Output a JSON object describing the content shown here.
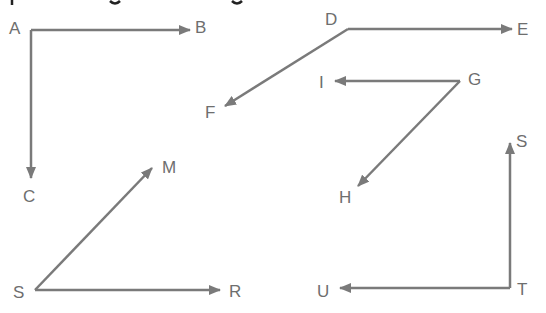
{
  "colors": {
    "stroke": "#7a7a7a",
    "label": "#6e6e6e",
    "background": "#ffffff"
  },
  "header": {
    "cropped_text_note": "top line of text cut off; only descenders visible"
  },
  "rays": [
    {
      "name": "AB",
      "from": "A",
      "to": "B",
      "x1": 31,
      "y1": 30,
      "x2": 190,
      "y2": 30
    },
    {
      "name": "AC",
      "from": "A",
      "to": "C",
      "x1": 31,
      "y1": 30,
      "x2": 31,
      "y2": 178
    },
    {
      "name": "DE",
      "from": "D",
      "to": "E",
      "x1": 348,
      "y1": 29,
      "x2": 512,
      "y2": 29
    },
    {
      "name": "DF",
      "from": "D",
      "to": "F",
      "x1": 348,
      "y1": 29,
      "x2": 225,
      "y2": 106
    },
    {
      "name": "GI",
      "from": "G",
      "to": "I",
      "x1": 460,
      "y1": 81,
      "x2": 335,
      "y2": 81
    },
    {
      "name": "GH",
      "from": "G",
      "to": "H",
      "x1": 460,
      "y1": 81,
      "x2": 358,
      "y2": 186
    },
    {
      "name": "SM",
      "from": "S",
      "to": "M",
      "x1": 35,
      "y1": 290,
      "x2": 152,
      "y2": 168
    },
    {
      "name": "SR",
      "from": "S",
      "to": "R",
      "x1": 35,
      "y1": 290,
      "x2": 220,
      "y2": 290
    },
    {
      "name": "TS",
      "from": "T",
      "to": "S",
      "x1": 510,
      "y1": 288,
      "x2": 510,
      "y2": 143
    },
    {
      "name": "TU",
      "from": "T",
      "to": "U",
      "x1": 510,
      "y1": 288,
      "x2": 340,
      "y2": 288
    }
  ],
  "labels": [
    {
      "id": "A",
      "text": "A",
      "x": 9,
      "y": 20
    },
    {
      "id": "B",
      "text": "B",
      "x": 195,
      "y": 19
    },
    {
      "id": "C",
      "text": "C",
      "x": 23,
      "y": 188
    },
    {
      "id": "D",
      "text": "D",
      "x": 325,
      "y": 11
    },
    {
      "id": "E",
      "text": "E",
      "x": 517,
      "y": 21
    },
    {
      "id": "F",
      "text": "F",
      "x": 205,
      "y": 104
    },
    {
      "id": "I",
      "text": "I",
      "x": 319,
      "y": 74
    },
    {
      "id": "G",
      "text": "G",
      "x": 468,
      "y": 71
    },
    {
      "id": "H",
      "text": "H",
      "x": 339,
      "y": 189
    },
    {
      "id": "M",
      "text": "M",
      "x": 162,
      "y": 159
    },
    {
      "id": "S1",
      "text": "S",
      "x": 13,
      "y": 284
    },
    {
      "id": "R",
      "text": "R",
      "x": 229,
      "y": 283
    },
    {
      "id": "S2",
      "text": "S",
      "x": 516,
      "y": 133
    },
    {
      "id": "U",
      "text": "U",
      "x": 317,
      "y": 283
    },
    {
      "id": "T",
      "text": "T",
      "x": 517,
      "y": 281
    }
  ]
}
